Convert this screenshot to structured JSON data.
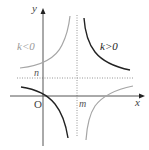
{
  "diagram": {
    "title": "",
    "axes": {
      "x_label": "x",
      "y_label": "y",
      "origin_label": "O"
    },
    "asymptotes": {
      "vertical_label": "m",
      "horizontal_label": "n"
    },
    "curves": [
      {
        "label": "k>0",
        "label_text": "k>0",
        "color": "#222222",
        "branches": [
          "upper-right",
          "lower-left"
        ]
      },
      {
        "label": "k<0",
        "label_text": "k<0",
        "color": "#9a9a9a",
        "branches": [
          "upper-left",
          "lower-right"
        ]
      }
    ],
    "colors": {
      "axis": "#555555",
      "asymptote": "#888888",
      "k_positive": "#222222",
      "k_negative": "#9a9a9a",
      "text": "#444444"
    }
  }
}
